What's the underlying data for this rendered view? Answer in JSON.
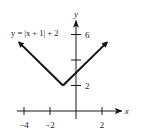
{
  "chart_data": {
    "type": "line",
    "title": "",
    "xlabel": "x",
    "ylabel": "y",
    "xlim": [
      -4.4,
      2.9
    ],
    "ylim": [
      -0.6,
      7
    ],
    "grid": false,
    "x_ticks": [
      {
        "value": -4,
        "label": "−4"
      },
      {
        "value": -2,
        "label": "−2"
      },
      {
        "value": 2,
        "label": "2"
      }
    ],
    "y_ticks": [
      {
        "value": 2,
        "label": "2"
      },
      {
        "value": 4,
        "label": ""
      },
      {
        "value": 6,
        "label": "6"
      }
    ],
    "series": [
      {
        "name": "y = |x + 1| + 2",
        "x": [
          -4.4,
          -1,
          2.4
        ],
        "y": [
          5.4,
          2,
          5.4
        ],
        "arrows": "both-ends",
        "color": "#111111"
      }
    ],
    "annotations": [
      {
        "text": "y = |x + 1| + 2",
        "position": "top-left"
      }
    ]
  }
}
